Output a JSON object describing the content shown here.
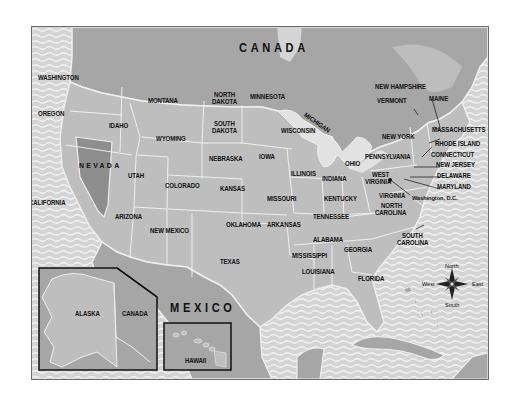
{
  "map": {
    "title": "United States Map",
    "colors": {
      "water": "#d6d6d6",
      "wave": "#f0f0f0",
      "us_states": "#bebebe",
      "highlight_state": "#8e8e8e",
      "foreign_land": "#a6a6a6",
      "lakes": "#e6e6e6",
      "border": "#ffffff"
    },
    "countries": {
      "canada": "CANADA",
      "mexico": "MEXICO",
      "canada_inset": "CANADA"
    },
    "highlighted_state": "NEVADA",
    "states": {
      "washington": "WASHINGTON",
      "oregon": "OREGON",
      "california": "CALIFORNIA",
      "nevada": "NEVADA",
      "idaho": "IDAHO",
      "montana": "MONTANA",
      "wyoming": "WYOMING",
      "utah": "UTAH",
      "arizona": "ARIZONA",
      "colorado": "COLORADO",
      "new_mexico": "NEW MEXICO",
      "north_dakota_1": "NORTH",
      "north_dakota_2": "DAKOTA",
      "south_dakota_1": "SOUTH",
      "south_dakota_2": "DAKOTA",
      "nebraska": "NEBRASKA",
      "kansas": "KANSAS",
      "oklahoma": "OKLAHOMA",
      "texas": "TEXAS",
      "minnesota": "MINNESOTA",
      "iowa": "IOWA",
      "missouri": "MISSOURI",
      "arkansas": "ARKANSAS",
      "louisiana": "LOUISIANA",
      "wisconsin": "WISCONSIN",
      "michigan": "MICHIGAN",
      "illinois": "ILLINOIS",
      "indiana": "INDIANA",
      "ohio": "OHIO",
      "kentucky": "KENTUCKY",
      "tennessee": "TENNESSEE",
      "mississippi": "MISSISSIPPI",
      "alabama": "ALABAMA",
      "georgia": "GEORGIA",
      "florida": "FLORIDA",
      "south_carolina_1": "SOUTH",
      "south_carolina_2": "CAROLINA",
      "north_carolina_1": "NORTH",
      "north_carolina_2": "CAROLINA",
      "virginia": "VIRGINIA",
      "west_virginia_1": "WEST",
      "west_virginia_2": "VIRGINIA",
      "pennsylvania": "PENNSYLVANIA",
      "new_york": "NEW YORK",
      "vermont": "VERMONT",
      "new_hampshire": "NEW HAMPSHIRE",
      "maine": "MAINE",
      "massachusetts": "MASSACHUSETTS",
      "rhode_island": "RHODE ISLAND",
      "connecticut": "CONNECTICUT",
      "new_jersey": "NEW JERSEY",
      "delaware": "DELAWARE",
      "maryland": "MARYLAND",
      "alaska": "ALASKA",
      "hawaii": "HAWAII"
    },
    "capital": "Washington, D.C.",
    "compass": {
      "north": "North",
      "south": "South",
      "east": "East",
      "west": "West"
    }
  }
}
